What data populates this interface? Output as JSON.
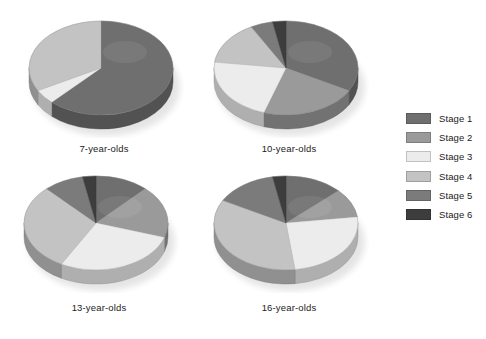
{
  "chart_data": {
    "type": "pie",
    "title": "",
    "subtitle": "",
    "xlabel": "",
    "ylabel": "",
    "legend_position": "right",
    "grid": false,
    "style": "3d-pie",
    "categories": [
      "Stage 1",
      "Stage 2",
      "Stage 3",
      "Stage 4",
      "Stage 5",
      "Stage 6"
    ],
    "colors": [
      "#6f6f6f",
      "#9a9a9a",
      "#ececed",
      "#c3c3c3",
      "#7b7b7b",
      "#3d3d3d"
    ],
    "charts": [
      {
        "label": "7-year-olds",
        "categories": [
          "Stage 1",
          "Stage 2",
          "Stage 3",
          "Stage 4",
          "Stage 5",
          "Stage 6"
        ],
        "values": [
          62,
          0,
          5,
          33,
          0,
          0
        ]
      },
      {
        "label": "10-year-olds",
        "categories": [
          "Stage 1",
          "Stage 2",
          "Stage 3",
          "Stage 4",
          "Stage 5",
          "Stage 6"
        ],
        "values": [
          33,
          22,
          22,
          15,
          5,
          3
        ]
      },
      {
        "label": "13-year-olds",
        "categories": [
          "Stage 1",
          "Stage 2",
          "Stage 3",
          "Stage 4",
          "Stage 5",
          "Stage 6"
        ],
        "values": [
          12,
          18,
          28,
          30,
          9,
          3
        ]
      },
      {
        "label": "16-year-olds",
        "categories": [
          "Stage 1",
          "Stage 2",
          "Stage 3",
          "Stage 4",
          "Stage 5",
          "Stage 6"
        ],
        "values": [
          13,
          10,
          25,
          35,
          14,
          3
        ]
      }
    ]
  },
  "legend": {
    "items": [
      {
        "label": "Stage 1",
        "color": "#6f6f6f"
      },
      {
        "label": "Stage 2",
        "color": "#9a9a9a"
      },
      {
        "label": "Stage 3",
        "color": "#ececed"
      },
      {
        "label": "Stage 4",
        "color": "#c3c3c3"
      },
      {
        "label": "Stage 5",
        "color": "#7b7b7b"
      },
      {
        "label": "Stage 6",
        "color": "#3d3d3d"
      }
    ]
  },
  "pies": [
    {
      "label": "7-year-olds"
    },
    {
      "label": "10-year-olds"
    },
    {
      "label": "13-year-olds"
    },
    {
      "label": "16-year-olds"
    }
  ]
}
